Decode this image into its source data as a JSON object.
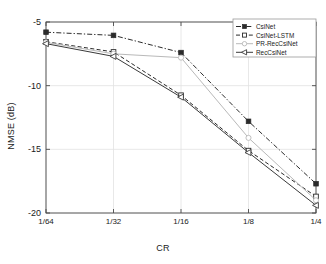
{
  "chart_data": {
    "type": "line",
    "title": "",
    "xlabel": "CR",
    "ylabel": "NMSE (dB)",
    "x_scale": "log",
    "categories": [
      "1/64",
      "1/32",
      "1/16",
      "1/8",
      "1/4"
    ],
    "x_tick_labels": [
      "1/64",
      "1/32",
      "1/16",
      "1/8",
      "1/4"
    ],
    "y_tick_labels": [
      "-5",
      "-10",
      "-15",
      "-20"
    ],
    "y_ticks": [
      -5,
      -10,
      -15,
      -20
    ],
    "ylim": [
      -20,
      -5
    ],
    "grid": true,
    "legend_position": "top-right",
    "series": [
      {
        "name": "CsiNet",
        "color": "#2b2b2b",
        "marker": "filled-square",
        "linestyle": "dash-dot",
        "values": [
          -5.8,
          -6.05,
          -7.4,
          -12.8,
          -17.7
        ]
      },
      {
        "name": "CsiNet-LSTM",
        "color": "#2b2b2b",
        "marker": "open-square",
        "linestyle": "dashed",
        "values": [
          -6.55,
          -7.35,
          -10.75,
          -15.1,
          -18.7
        ]
      },
      {
        "name": "PR-RecCsiNet",
        "color": "#b9b9b9",
        "marker": "open-circle",
        "linestyle": "solid",
        "values": [
          -6.6,
          -7.5,
          -7.8,
          -14.1,
          -19.0
        ]
      },
      {
        "name": "RecCsiNet",
        "color": "#3a3a3a",
        "marker": "left-triangle",
        "linestyle": "solid",
        "values": [
          -6.7,
          -7.7,
          -10.9,
          -15.25,
          -19.4
        ]
      }
    ]
  },
  "legend": {
    "entries": [
      {
        "label": "CsiNet"
      },
      {
        "label": "CsiNet-LSTM"
      },
      {
        "label": "PR-RecCsiNet"
      },
      {
        "label": "RecCsiNet"
      }
    ]
  },
  "colors": {
    "axis": "#4a4a4a",
    "grid": "#e2e2e2",
    "background": "#ffffff",
    "text": "#1a1a1a"
  }
}
